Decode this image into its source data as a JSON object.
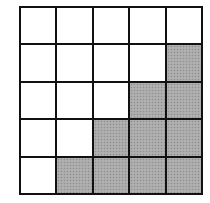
{
  "grid": {
    "rows": 5,
    "cols": 5,
    "line_color": "#111111",
    "empty_color": "#ffffff",
    "shade_color": "#a9a9a9",
    "cells": [
      [
        0,
        0,
        0,
        0,
        0
      ],
      [
        0,
        0,
        0,
        0,
        1
      ],
      [
        0,
        0,
        0,
        1,
        1
      ],
      [
        0,
        0,
        1,
        1,
        1
      ],
      [
        0,
        1,
        1,
        1,
        1
      ]
    ]
  }
}
